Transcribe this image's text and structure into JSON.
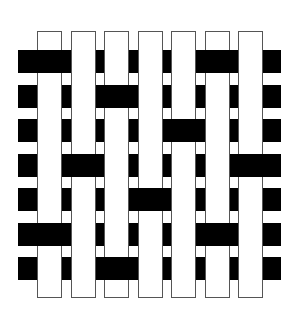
{
  "diagram": {
    "type": "weave-pattern",
    "colors": {
      "weft": "#000000",
      "warp_fill": "#ffffff",
      "warp_outline": "#555555",
      "background": "#ffffff"
    },
    "warp_count": 7,
    "weft_count": 7,
    "weft_over_warp": [
      {
        "row": 1,
        "over_columns": [
          1,
          6
        ]
      },
      {
        "row": 2,
        "over_columns": [
          3
        ]
      },
      {
        "row": 3,
        "over_columns": [
          5
        ]
      },
      {
        "row": 4,
        "over_columns": [
          2,
          7
        ]
      },
      {
        "row": 5,
        "over_columns": [
          4
        ]
      },
      {
        "row": 6,
        "over_columns": [
          1,
          6
        ]
      },
      {
        "row": 7,
        "over_columns": [
          3
        ]
      }
    ]
  }
}
